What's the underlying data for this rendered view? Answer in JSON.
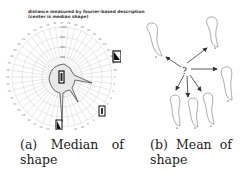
{
  "figure": {
    "subfigures": [
      {
        "id": "a",
        "label": "(a)",
        "caption_line1_words": [
          "(a)",
          "Median",
          "of"
        ],
        "caption_line2": "shape",
        "caption": "(a) Median of shape",
        "chart_title_line1": "distance measured by fourier-based description",
        "chart_title_line2": "(center is median shape)"
      },
      {
        "id": "b",
        "label": "(b)",
        "caption_line1_words": [
          "(b)",
          "Mean",
          "of"
        ],
        "caption_line2": "shape",
        "caption": "(b) Mean of shape",
        "center_symbol": "?",
        "shape_label": "s"
      }
    ]
  },
  "chart_data": {
    "type": "polar",
    "title": "distance measured by fourier-based description (center is median shape)",
    "radial_ticks": [
      "0",
      "200",
      "400",
      "600",
      "800",
      "1000"
    ],
    "angular_count": 48,
    "series": [
      {
        "name": "distance profile",
        "description": "irregular closed contour around center with three long spikes (toward upper-right, lower-right, and bottom)",
        "spikes": [
          {
            "direction_deg": 20,
            "approx_radius": 0.85
          },
          {
            "direction_deg": -55,
            "approx_radius": 0.55
          },
          {
            "direction_deg": -95,
            "approx_radius": 0.95
          }
        ]
      }
    ],
    "thumbnails": 4,
    "grid": true
  }
}
